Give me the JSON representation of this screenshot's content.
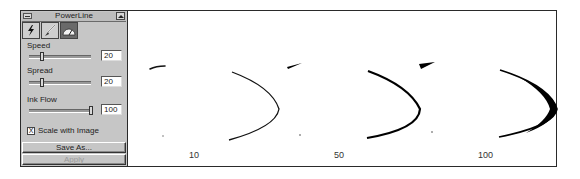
{
  "panel": {
    "title": "PowerLine",
    "tools": [
      {
        "name": "lightning-tool",
        "icon": "lightning-icon",
        "active": false
      },
      {
        "name": "brush-tool",
        "icon": "brush-icon",
        "active": false
      },
      {
        "name": "gauge-tool",
        "icon": "gauge-icon",
        "active": true
      }
    ],
    "speed": {
      "label": "Speed",
      "value": "20"
    },
    "spread": {
      "label": "Spread",
      "value": "20"
    },
    "ink_flow": {
      "label": "Ink Flow",
      "value": "100"
    },
    "scale_with_image": {
      "label": "Scale with Image",
      "checked": true,
      "mark": "X"
    },
    "save_as_label": "Save As...",
    "apply_label": "Apply"
  },
  "canvas": {
    "samples": [
      {
        "label": "10"
      },
      {
        "label": "50"
      },
      {
        "label": "100"
      }
    ]
  }
}
